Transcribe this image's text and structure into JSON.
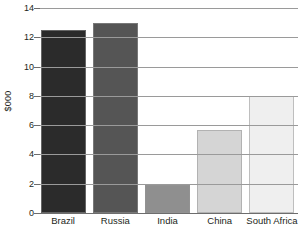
{
  "chart_data": {
    "type": "bar",
    "title": "",
    "xlabel": "",
    "ylabel": "$000",
    "categories": [
      "Brazil",
      "Russia",
      "India",
      "China",
      "South Africa"
    ],
    "values": [
      12.5,
      13.0,
      1.9,
      5.7,
      8.0
    ],
    "bar_colors": [
      "#2b2b2b",
      "#555555",
      "#8f8f8f",
      "#d5d5d5",
      "#efefef"
    ],
    "ylim": [
      0,
      14
    ],
    "yticks": [
      0,
      2,
      4,
      6,
      8,
      10,
      12,
      14
    ],
    "ytick_labels": [
      "0",
      "2",
      "4",
      "6",
      "8",
      "10",
      "12",
      "14"
    ],
    "grid": true,
    "legend": false,
    "legend_position": "none",
    "background": "#ffffff",
    "grid_color": "#9a9a9a",
    "axis_color": "#6d6d6d",
    "text_color": "#231f20"
  }
}
